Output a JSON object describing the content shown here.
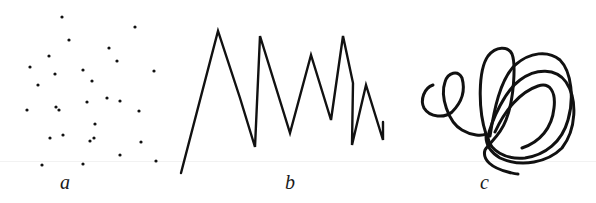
{
  "figure": {
    "panels": [
      {
        "id": "a",
        "label": "a",
        "kind": "scattered dots",
        "dots": [
          [
            62,
            17
          ],
          [
            135,
            27
          ],
          [
            69,
            40
          ],
          [
            109,
            48
          ],
          [
            49,
            56
          ],
          [
            117,
            61
          ],
          [
            30,
            67
          ],
          [
            55,
            74
          ],
          [
            83,
            70
          ],
          [
            154,
            71
          ],
          [
            92,
            81
          ],
          [
            38,
            85
          ],
          [
            27,
            110
          ],
          [
            56,
            107
          ],
          [
            59,
            110
          ],
          [
            87,
            102
          ],
          [
            107,
            98
          ],
          [
            120,
            101
          ],
          [
            139,
            111
          ],
          [
            95,
            124
          ],
          [
            50,
            138
          ],
          [
            63,
            135
          ],
          [
            90,
            141
          ],
          [
            94,
            138
          ],
          [
            141,
            142
          ],
          [
            120,
            155
          ],
          [
            42,
            165
          ],
          [
            83,
            164
          ],
          [
            156,
            161
          ]
        ]
      },
      {
        "id": "b",
        "label": "b",
        "kind": "zigzag line",
        "points": [
          [
            181,
            173
          ],
          [
            218,
            31
          ],
          [
            240,
            98
          ],
          [
            255,
            147
          ],
          [
            260,
            36
          ],
          [
            290,
            133
          ],
          [
            311,
            55
          ],
          [
            331,
            120
          ],
          [
            343,
            36
          ],
          [
            353,
            83
          ],
          [
            352,
            145
          ],
          [
            366,
            85
          ],
          [
            383,
            140
          ],
          [
            383,
            122
          ]
        ]
      },
      {
        "id": "c",
        "label": "c",
        "kind": "scribbled loops"
      }
    ],
    "colors": {
      "ink": "#111111",
      "background": "#ffffff"
    }
  }
}
